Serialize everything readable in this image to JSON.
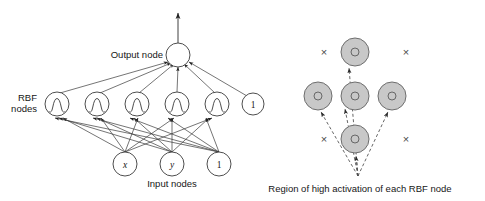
{
  "figure": {
    "type": "diagram",
    "background_color": "#ffffff",
    "line_color": "#333333",
    "gray_fill": "#c8c8c8",
    "gray_stroke": "#6e6e6e"
  },
  "left_diagram": {
    "name": "rbf-network-architecture",
    "labels": {
      "output": "Output node",
      "rbf_line1": "RBF",
      "rbf_line2": "nodes",
      "input": "Input nodes"
    },
    "output_node": {
      "label": "",
      "cx": 178,
      "cy": 55,
      "r": 12
    },
    "output_arrow": {
      "from_y": 43,
      "to_y": 12,
      "x": 178
    },
    "rbf_nodes": [
      {
        "label": "",
        "glyph": "gaussian-bump",
        "cx": 57,
        "cy": 104,
        "r": 12
      },
      {
        "label": "",
        "glyph": "gaussian-bump",
        "cx": 97,
        "cy": 104,
        "r": 12
      },
      {
        "label": "",
        "glyph": "gaussian-bump",
        "cx": 137,
        "cy": 104,
        "r": 12
      },
      {
        "label": "",
        "glyph": "gaussian-bump",
        "cx": 177,
        "cy": 104,
        "r": 12
      },
      {
        "label": "",
        "glyph": "gaussian-bump",
        "cx": 217,
        "cy": 104,
        "r": 12
      },
      {
        "label": "1",
        "glyph": "bias",
        "cx": 253,
        "cy": 104,
        "r": 11
      }
    ],
    "input_nodes": [
      {
        "label": "x",
        "style": "italic",
        "cx": 125,
        "cy": 164,
        "r": 12
      },
      {
        "label": "y",
        "style": "italic",
        "cx": 172,
        "cy": 164,
        "r": 12
      },
      {
        "label": "1",
        "style": "roman",
        "cx": 219,
        "cy": 164,
        "r": 12
      }
    ]
  },
  "right_diagram": {
    "name": "activation-region",
    "caption": "Region of high activation of each RBF node",
    "activation_circles": [
      {
        "cx": 355,
        "cy": 52,
        "r_outer": 14,
        "r_inner": 4
      },
      {
        "cx": 318,
        "cy": 96,
        "r_outer": 14,
        "r_inner": 4
      },
      {
        "cx": 355,
        "cy": 96,
        "r_outer": 14,
        "r_inner": 4
      },
      {
        "cx": 392,
        "cy": 96,
        "r_outer": 14,
        "r_inner": 4
      },
      {
        "cx": 355,
        "cy": 139,
        "r_outer": 14,
        "r_inner": 4
      }
    ],
    "x_marks": [
      {
        "symbol": "×",
        "cx": 324,
        "cy": 52
      },
      {
        "symbol": "×",
        "cx": 406,
        "cy": 52
      },
      {
        "symbol": "×",
        "cx": 324,
        "cy": 139
      },
      {
        "symbol": "×",
        "cx": 406,
        "cy": 139
      }
    ],
    "origin": {
      "x": 358,
      "y": 176
    },
    "arrow_style": "dashed"
  }
}
